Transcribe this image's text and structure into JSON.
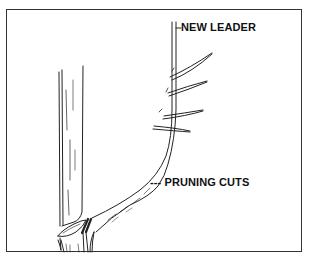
{
  "figure": {
    "type": "botanical line illustration",
    "labels": {
      "new_leader": "NEW LEADER",
      "pruning_cuts": "PRUNING CUTS",
      "pruning_cuts_marker": "---"
    },
    "colors": {
      "line": "#222222",
      "background": "#ffffff",
      "border": "#333333"
    }
  }
}
